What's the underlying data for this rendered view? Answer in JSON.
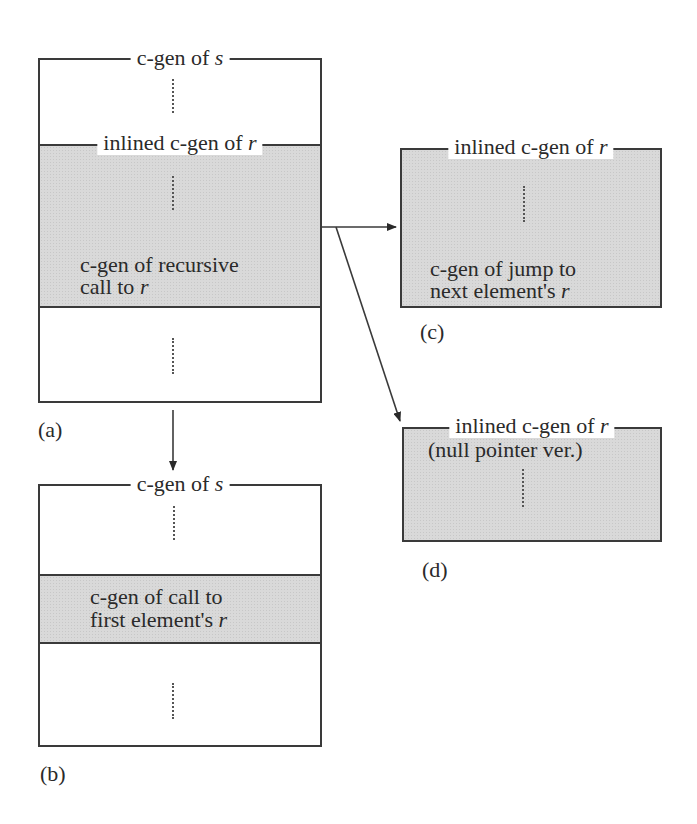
{
  "diagram": {
    "panels": {
      "a": {
        "caption": "(a)",
        "outer_label": "c-gen of",
        "outer_label_var": "s",
        "inlined_label": "inlined c-gen of",
        "inlined_label_var": "r",
        "gray_text_line1": "c-gen of recursive",
        "gray_text_line2": "call to",
        "gray_text_line2_var": "r"
      },
      "b": {
        "caption": "(b)",
        "outer_label": "c-gen of",
        "outer_label_var": "s",
        "gray_text_line1": "c-gen of call to",
        "gray_text_line2": "first element's",
        "gray_text_line2_var": "r"
      },
      "c": {
        "caption": "(c)",
        "label": "inlined c-gen of",
        "label_var": "r",
        "text_line1": "c-gen of jump to",
        "text_line2": "next element's",
        "text_line2_var": "r"
      },
      "d": {
        "caption": "(d)",
        "label": "inlined c-gen of",
        "label_var": "r",
        "subtitle": "(null pointer ver.)"
      }
    },
    "arrows": [
      {
        "from": "a",
        "to": "b",
        "direction": "down"
      },
      {
        "from": "a",
        "to": "c",
        "direction": "right"
      },
      {
        "from": "a",
        "to": "d",
        "direction": "diagonal"
      }
    ],
    "colors": {
      "shade": "#d9d9d9",
      "line": "#3a3a3a",
      "background": "#ffffff"
    }
  }
}
